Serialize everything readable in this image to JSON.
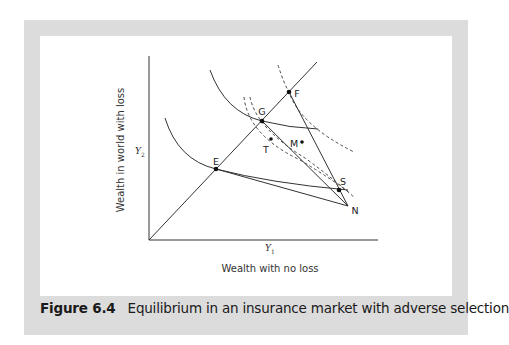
{
  "figure": {
    "number": "Figure 6.4",
    "title": "Equilibrium in an insurance market with adverse selection"
  },
  "axes": {
    "ylabel": "Wealth in world with loss",
    "xlabel": "Wealth with no loss",
    "y_tick": "Y",
    "y_tick_sub": "2",
    "x_tick": "Y",
    "x_tick_sub": "1"
  },
  "points": {
    "E": "E",
    "G": "G",
    "F": "F",
    "T": "T",
    "M": "M",
    "S": "S",
    "N": "N"
  },
  "colors": {
    "frame": "#dcdcdc",
    "line": "#333333"
  }
}
